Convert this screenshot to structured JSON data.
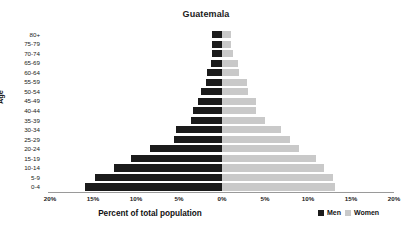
{
  "chart_data": {
    "type": "bar",
    "subtype": "population-pyramid",
    "title": "Guatemala",
    "xlabel": "Percent of total population",
    "ylabel": "Age",
    "categories": [
      "80+",
      "75-79",
      "70-74",
      "65-69",
      "60-64",
      "55-59",
      "50-54",
      "45-49",
      "40-44",
      "35-39",
      "30-34",
      "25-29",
      "20-24",
      "15-19",
      "10-14",
      "5-9",
      "0-4"
    ],
    "series": [
      {
        "name": "Men",
        "color": "#1b1b1b",
        "values": [
          1.2,
          1.2,
          1.2,
          1.3,
          1.8,
          1.9,
          2.4,
          2.8,
          3.4,
          3.6,
          5.4,
          5.6,
          8.4,
          10.6,
          12.6,
          14.8,
          15.9
        ]
      },
      {
        "name": "Women",
        "color": "#c9c9c9",
        "values": [
          1.0,
          1.1,
          1.3,
          1.9,
          2.0,
          2.9,
          3.0,
          4.0,
          4.0,
          5.0,
          6.9,
          7.9,
          9.0,
          10.9,
          11.9,
          12.9,
          13.1
        ]
      }
    ],
    "xticks": [
      "20%",
      "15%",
      "10%",
      "5%",
      "0%",
      "5%",
      "10%",
      "15%",
      "20%"
    ],
    "xtick_values": [
      -20,
      -15,
      -10,
      -5,
      0,
      5,
      10,
      15,
      20
    ],
    "xlim": [
      -20,
      20
    ],
    "grid": false,
    "legend_position": "bottom-right",
    "legend": [
      "Men",
      "Women"
    ]
  },
  "legend": {
    "men_label": "Men",
    "women_label": "Women"
  }
}
